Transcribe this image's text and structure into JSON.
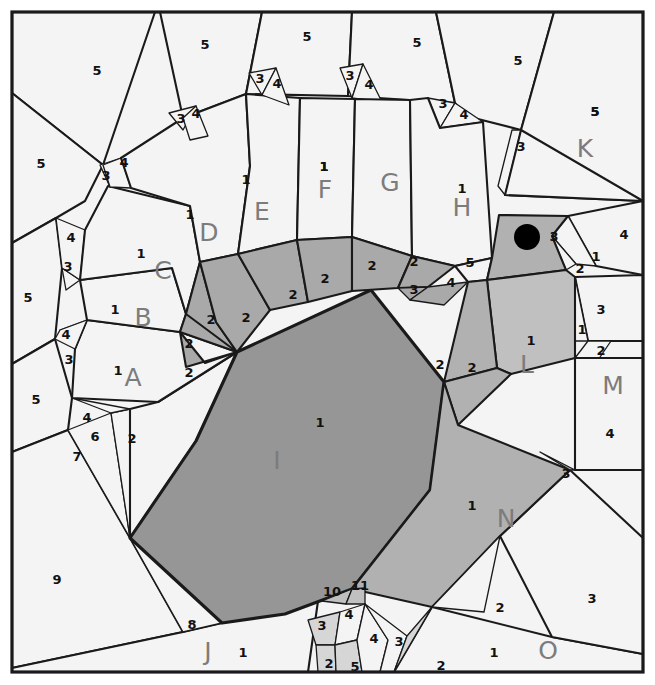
{
  "figure": {
    "width": 655,
    "height": 685,
    "background_color": "#ffffff",
    "frame_color": "#1a1a1a"
  },
  "palette": {
    "background_cell": "#f4f4f4",
    "light_gray": "#e9e9e9",
    "mid_gray": "#c9c9c9",
    "ring_gray": "#a9a9a9",
    "region_gray": "#b1b1b1",
    "core_dark": "#969696",
    "outline": "#1a1a1a",
    "letter_text": "#7c7c7c",
    "number_text": "#111111",
    "marker": "#000000"
  },
  "marker": {
    "name": "black-dot",
    "cx": 527,
    "cy": 237,
    "r": 13
  },
  "region_letters": [
    {
      "id": "A",
      "label": "A",
      "x": 133,
      "y": 379
    },
    {
      "id": "B",
      "label": "B",
      "x": 143,
      "y": 319
    },
    {
      "id": "C",
      "label": "C",
      "x": 163,
      "y": 272
    },
    {
      "id": "D",
      "label": "D",
      "x": 209,
      "y": 234
    },
    {
      "id": "E",
      "label": "E",
      "x": 262,
      "y": 213
    },
    {
      "id": "F",
      "label": "F",
      "x": 325,
      "y": 191
    },
    {
      "id": "G",
      "label": "G",
      "x": 390,
      "y": 184
    },
    {
      "id": "H",
      "label": "H",
      "x": 462,
      "y": 209
    },
    {
      "id": "I",
      "label": "I",
      "x": 277,
      "y": 462
    },
    {
      "id": "J",
      "label": "J",
      "x": 208,
      "y": 653
    },
    {
      "id": "K",
      "label": "K",
      "x": 585,
      "y": 150
    },
    {
      "id": "L",
      "label": "L",
      "x": 527,
      "y": 366
    },
    {
      "id": "M",
      "label": "M",
      "x": 613,
      "y": 387
    },
    {
      "id": "N",
      "label": "N",
      "x": 506,
      "y": 520
    },
    {
      "id": "O",
      "label": "O",
      "x": 548,
      "y": 652
    }
  ],
  "cells": [
    {
      "name": "cell-outer-top-left-5",
      "value": "5",
      "fill": "#f4f4f4",
      "stroke": "med",
      "lx": 97,
      "ly": 71,
      "points": "12,12 155,12 103,165 12,93"
    },
    {
      "name": "cell-outer-top-5a",
      "value": "5",
      "fill": "#f4f4f4",
      "stroke": "med",
      "lx": 205,
      "ly": 45,
      "points": "155,12 262,12 246,94 183,118 160,12"
    },
    {
      "name": "cell-outer-top-5b",
      "value": "5",
      "fill": "#f4f4f4",
      "stroke": "med",
      "lx": 307,
      "ly": 37,
      "points": "262,12 352,12 348,96 246,94"
    },
    {
      "name": "cell-outer-top-5c",
      "value": "5",
      "fill": "#f4f4f4",
      "stroke": "med",
      "lx": 417,
      "ly": 43,
      "points": "352,12 436,12 455,103 348,96"
    },
    {
      "name": "cell-outer-top-5d",
      "value": "5",
      "fill": "#f4f4f4",
      "stroke": "med",
      "lx": 518,
      "ly": 61,
      "points": "436,12 554,12 521,130 466,116 455,103"
    },
    {
      "name": "cell-outer-right-5k",
      "value": "5",
      "fill": "#f4f4f4",
      "stroke": "med",
      "lx": 595,
      "ly": 112,
      "points": "554,12 643,12 643,201 505,195 521,130"
    },
    {
      "name": "cell-outer-left-5b",
      "value": "5",
      "fill": "#f4f4f4",
      "stroke": "med",
      "lx": 41,
      "ly": 164,
      "points": "12,93 103,165 85,201 56,218 12,243"
    },
    {
      "name": "cell-outer-left-5c",
      "value": "5",
      "fill": "#f4f4f4",
      "stroke": "med",
      "lx": 28,
      "ly": 298,
      "points": "12,243 56,218 62,268 55,339 12,364"
    },
    {
      "name": "cell-outer-left-5d",
      "value": "5",
      "fill": "#f4f4f4",
      "stroke": "med",
      "lx": 36,
      "ly": 400,
      "points": "12,364 55,339 72,398 68,430 12,452"
    },
    {
      "name": "cell-outer-bottom-left-9",
      "value": "9",
      "fill": "#f4f4f4",
      "stroke": "med",
      "lx": 57,
      "ly": 580,
      "points": "12,452 68,430 130,538 183,632 12,668"
    },
    {
      "name": "cell-J",
      "value": "1",
      "fill": "#f4f4f4",
      "stroke": "med",
      "lx": 243,
      "ly": 653,
      "points": "183,632 318,601 308,672 12,672 12,668"
    },
    {
      "name": "cell-tri-8",
      "value": "8",
      "fill": "#f4f4f4",
      "stroke": "thin",
      "lx": 192,
      "ly": 625,
      "points": "130,538 222,623 183,632"
    },
    {
      "name": "cell-fan-7",
      "value": "7",
      "fill": "#f4f4f4",
      "stroke": "thin",
      "lx": 77,
      "ly": 457,
      "points": "68,430 111,413 130,538"
    },
    {
      "name": "cell-fan-6",
      "value": "6",
      "fill": "#f4f4f4",
      "stroke": "thin",
      "lx": 95,
      "ly": 437,
      "points": "111,413 130,409 130,538"
    },
    {
      "name": "cell-fan-4low",
      "value": "4",
      "fill": "#f4f4f4",
      "stroke": "thin",
      "lx": 87,
      "ly": 418,
      "points": "72,398 130,409 111,413"
    },
    {
      "name": "cell-mid-2-lowerleft",
      "value": "2",
      "fill": "#f4f4f4",
      "stroke": "med",
      "lx": 132,
      "ly": 439,
      "points": "130,409 158,402 237,352 196,441 130,538"
    },
    {
      "name": "cell-A",
      "value": "1",
      "fill": "#f4f4f4",
      "stroke": "med",
      "lx": 118,
      "ly": 371,
      "points": "75,349 87,320 180,332 237,352 158,402 72,398"
    },
    {
      "name": "cell-tri-3A",
      "value": "3",
      "fill": "#f4f4f4",
      "stroke": "thin",
      "lx": 69,
      "ly": 360,
      "points": "60,330 87,320 75,349"
    },
    {
      "name": "cell-tri-4A",
      "value": "4",
      "fill": "#f4f4f4",
      "stroke": "thin",
      "lx": 66,
      "ly": 335,
      "points": "55,339 60,330 87,320 75,349"
    },
    {
      "name": "cell-B",
      "value": "1",
      "fill": "#f4f4f4",
      "stroke": "med",
      "lx": 115,
      "ly": 310,
      "points": "80,280 172,268 186,314 180,332 87,320"
    },
    {
      "name": "cell-tri-3B",
      "value": "3",
      "fill": "#f4f4f4",
      "stroke": "thin",
      "lx": 68,
      "ly": 267,
      "points": "62,268 80,280 66,290"
    },
    {
      "name": "cell-tri-4B",
      "value": "4",
      "fill": "#f4f4f4",
      "stroke": "thin",
      "lx": 71,
      "ly": 238,
      "points": "56,218 85,230 80,280 62,268"
    },
    {
      "name": "cell-C",
      "value": "1",
      "fill": "#f4f4f4",
      "stroke": "med",
      "lx": 141,
      "ly": 254,
      "points": "108,186 190,206 200,262 186,314 172,268 80,280 85,230"
    },
    {
      "name": "cell-tri-3C",
      "value": "3",
      "fill": "#f4f4f4",
      "stroke": "thin",
      "lx": 106,
      "ly": 176,
      "points": "100,165 121,158 110,187"
    },
    {
      "name": "cell-tri-4C",
      "value": "4",
      "fill": "#f4f4f4",
      "stroke": "thin",
      "lx": 124,
      "ly": 163,
      "points": "103,165 121,158 131,188 110,187"
    },
    {
      "name": "cell-D",
      "value": "1",
      "fill": "#f4f4f4",
      "stroke": "med",
      "lx": 190,
      "ly": 215,
      "points": "183,118 246,94 250,166 238,254 200,262 190,206 131,188 121,158"
    },
    {
      "name": "cell-tri-3D",
      "value": "3",
      "fill": "#f4f4f4",
      "stroke": "thin",
      "lx": 181,
      "ly": 119,
      "points": "169,113 196,106 183,130"
    },
    {
      "name": "cell-tri-4D",
      "value": "4",
      "fill": "#f4f4f4",
      "stroke": "thin",
      "lx": 196,
      "ly": 114,
      "points": "183,118 196,106 208,136 190,140"
    },
    {
      "name": "cell-E",
      "value": "1",
      "fill": "#f4f4f4",
      "stroke": "med",
      "lx": 246,
      "ly": 180,
      "points": "246,94 300,98 297,240 238,254 250,166"
    },
    {
      "name": "cell-tri-3E",
      "value": "3",
      "fill": "#f4f4f4",
      "stroke": "thin",
      "lx": 260,
      "ly": 79,
      "points": "249,73 276,68 262,95"
    },
    {
      "name": "cell-tri-4E",
      "value": "4",
      "fill": "#f4f4f4",
      "stroke": "thin",
      "lx": 277,
      "ly": 84,
      "points": "262,95 276,68 289,105"
    },
    {
      "name": "cell-F",
      "value": "1",
      "fill": "#f4f4f4",
      "stroke": "med",
      "lx": 324,
      "ly": 167,
      "points": "300,98 355,99 352,237 297,240"
    },
    {
      "name": "cell-tri-3F",
      "value": "3",
      "fill": "#f4f4f4",
      "stroke": "thin",
      "lx": 350,
      "ly": 76,
      "points": "340,68 363,64 352,98"
    },
    {
      "name": "cell-tri-4F",
      "value": "4",
      "fill": "#f4f4f4",
      "stroke": "thin",
      "lx": 369,
      "ly": 85,
      "points": "352,98 363,64 382,102"
    },
    {
      "name": "cell-G",
      "value": "1",
      "fill": "#f4f4f4",
      "stroke": "med",
      "lx": 324,
      "ly": 167,
      "points": "355,99 410,100 412,256 352,237"
    },
    {
      "name": "cell-tri-3G",
      "value": "3",
      "fill": "#f4f4f4",
      "stroke": "thin",
      "lx": 443,
      "ly": 104,
      "points": "428,98 455,103 440,128"
    },
    {
      "name": "cell-tri-4G",
      "value": "4",
      "fill": "#f4f4f4",
      "stroke": "thin",
      "lx": 464,
      "ly": 115,
      "points": "440,128 455,103 483,122"
    },
    {
      "name": "cell-H",
      "value": "1",
      "fill": "#f4f4f4",
      "stroke": "med",
      "lx": 462,
      "ly": 189,
      "points": "410,100 428,98 440,128 483,122 492,258 455,266 412,256"
    },
    {
      "name": "cell-tri-3H",
      "value": "3",
      "fill": "#f4f4f4",
      "stroke": "thin",
      "lx": 521,
      "ly": 147,
      "points": "512,130 521,130 505,195 498,186"
    },
    {
      "name": "cell-K-main",
      "value": "5",
      "fill": "#f4f4f4",
      "stroke": "med",
      "lx": 595,
      "ly": 112,
      "points": "521,130 643,201 643,201 505,195"
    },
    {
      "name": "cell-right-4",
      "value": "4",
      "fill": "#f4f4f4",
      "stroke": "med",
      "lx": 624,
      "ly": 235,
      "points": "568,216 643,201 643,275 596,266"
    },
    {
      "name": "cell-right-1a",
      "value": "1",
      "fill": "#f4f4f4",
      "stroke": "thin",
      "lx": 596,
      "ly": 257,
      "points": "552,236 568,216 596,266 576,264"
    },
    {
      "name": "cell-right-2a",
      "value": "2",
      "fill": "#f4f4f4",
      "stroke": "thin",
      "lx": 580,
      "ly": 269,
      "points": "552,236 576,264 566,270"
    },
    {
      "name": "cell-right-3",
      "value": "3",
      "fill": "#f4f4f4",
      "stroke": "med",
      "lx": 601,
      "ly": 310,
      "points": "575,277 643,275 643,341 588,341"
    },
    {
      "name": "cell-right-1b",
      "value": "1",
      "fill": "#f4f4f4",
      "stroke": "thin",
      "lx": 582,
      "ly": 330,
      "points": "575,277 588,341 575,341"
    },
    {
      "name": "cell-right-2b",
      "value": "2",
      "fill": "#f4f4f4",
      "stroke": "thin",
      "lx": 601,
      "ly": 351,
      "points": "588,341 611,341 598,360 575,358"
    },
    {
      "name": "cell-M",
      "value": "4",
      "fill": "#f4f4f4",
      "stroke": "med",
      "lx": 610,
      "ly": 434,
      "points": "575,358 643,358 643,470 575,470"
    },
    {
      "name": "cell-O",
      "value": "1",
      "fill": "#f4f4f4",
      "stroke": "med",
      "lx": 494,
      "ly": 653,
      "points": "432,607 552,637 643,654 643,672 394,672"
    },
    {
      "name": "cell-O-3",
      "value": "3",
      "fill": "#f4f4f4",
      "stroke": "med",
      "lx": 592,
      "ly": 599,
      "points": "500,536 570,470 643,538 643,654 552,637"
    },
    {
      "name": "cell-dark-I",
      "value": "1",
      "fill": "#969696",
      "stroke": "thick",
      "lx": 320,
      "ly": 423,
      "points": "237,352 371,290 444,382 430,490 352,589 285,614 222,623 130,538 196,441"
    },
    {
      "name": "ring-2a",
      "value": "2",
      "fill": "#a9a9a9",
      "stroke": "med",
      "lx": 189,
      "ly": 373,
      "points": "180,332 205,363 237,352 186,367"
    },
    {
      "name": "ring-2b",
      "value": "2",
      "fill": "#a9a9a9",
      "stroke": "med",
      "lx": 189,
      "ly": 344,
      "points": "186,314 216,322 237,352 180,332"
    },
    {
      "name": "ring-2c",
      "value": "2",
      "fill": "#a9a9a9",
      "stroke": "med",
      "lx": 211,
      "ly": 320,
      "points": "200,262 216,322 237,352 186,314"
    },
    {
      "name": "ring-2d",
      "value": "2",
      "fill": "#a9a9a9",
      "stroke": "med",
      "lx": 246,
      "ly": 318,
      "points": "200,262 238,254 270,310 237,352 216,322"
    },
    {
      "name": "ring-2e",
      "value": "2",
      "fill": "#a9a9a9",
      "stroke": "med",
      "lx": 293,
      "ly": 295,
      "points": "238,254 297,240 308,302 270,310"
    },
    {
      "name": "ring-2f",
      "value": "2",
      "fill": "#a9a9a9",
      "stroke": "med",
      "lx": 325,
      "ly": 279,
      "points": "297,240 352,237 352,291 308,302"
    },
    {
      "name": "ring-2g",
      "value": "2",
      "fill": "#a9a9a9",
      "stroke": "med",
      "lx": 372,
      "ly": 266,
      "points": "352,237 412,256 398,288 352,291"
    },
    {
      "name": "ring-2h",
      "value": "2",
      "fill": "#a9a9a9",
      "stroke": "med",
      "lx": 414,
      "ly": 262,
      "points": "412,256 455,266 428,287 398,288"
    },
    {
      "name": "ring-3i",
      "value": "3",
      "fill": "#a9a9a9",
      "stroke": "thin",
      "lx": 414,
      "ly": 290,
      "points": "398,288 428,287 410,300"
    },
    {
      "name": "ring-4i",
      "value": "4",
      "fill": "#a9a9a9",
      "stroke": "thin",
      "lx": 451,
      "ly": 283,
      "points": "428,287 468,282 444,305 410,300"
    },
    {
      "name": "ring-5i",
      "value": "5",
      "fill": "#f4f4f4",
      "stroke": "med",
      "lx": 470,
      "ly": 263,
      "points": "455,266 492,258 487,280 468,282"
    },
    {
      "name": "cell-dot-3",
      "value": "3",
      "fill": "#b1b1b1",
      "stroke": "med",
      "lx": 554,
      "ly": 237,
      "points": "492,258 499,215 568,216 552,236 566,270 487,280"
    },
    {
      "name": "cell-L",
      "value": "1",
      "fill": "#c0c0c0",
      "stroke": "med",
      "lx": 531,
      "ly": 341,
      "points": "487,280 566,270 575,277 575,358 511,374 497,368"
    },
    {
      "name": "cell-2-left-of-L",
      "value": "2",
      "fill": "#b1b1b1",
      "stroke": "med",
      "lx": 472,
      "ly": 368,
      "points": "468,282 487,280 497,368 444,382"
    },
    {
      "name": "cell-2-above-N",
      "value": "2",
      "fill": "#b1b1b1",
      "stroke": "med",
      "lx": 440,
      "ly": 365,
      "points": "444,382 497,368 511,374 458,425"
    },
    {
      "name": "cell-N",
      "value": "1",
      "fill": "#b1b1b1",
      "stroke": "med",
      "lx": 472,
      "ly": 506,
      "points": "444,382 458,425 570,470 500,536 432,607 352,589 430,490"
    },
    {
      "name": "cell-N-3",
      "value": "3",
      "fill": "#b1b1b1",
      "stroke": "thin",
      "lx": 566,
      "ly": 474,
      "points": "540,452 575,470 570,470"
    },
    {
      "name": "cell-2-below-N",
      "value": "2",
      "fill": "#f4f4f4",
      "stroke": "thin",
      "lx": 500,
      "ly": 608,
      "points": "432,607 500,536 500,536 484,612"
    },
    {
      "name": "bottom-10",
      "value": "10",
      "fill": "#c0c0c0",
      "stroke": "thin",
      "lx": 332,
      "ly": 592,
      "points": "322,601 352,589 346,604"
    },
    {
      "name": "bottom-11",
      "value": "11",
      "fill": "#c0c0c0",
      "stroke": "thin",
      "lx": 360,
      "ly": 586,
      "points": "346,604 352,589 365,588 365,604"
    },
    {
      "name": "bottom-3a",
      "value": "3",
      "fill": "#d6d6d6",
      "stroke": "thin",
      "lx": 322,
      "ly": 626,
      "points": "308,620 340,612 335,645 316,645"
    },
    {
      "name": "bottom-4a",
      "value": "4",
      "fill": "#f4f4f4",
      "stroke": "thin",
      "lx": 349,
      "ly": 615,
      "points": "340,612 365,604 357,640 335,645"
    },
    {
      "name": "bottom-2a",
      "value": "2",
      "fill": "#d6d6d6",
      "stroke": "thin",
      "lx": 329,
      "ly": 664,
      "points": "316,645 335,645 336,672 318,672"
    },
    {
      "name": "bottom-5a",
      "value": "5",
      "fill": "#d6d6d6",
      "stroke": "thin",
      "lx": 355,
      "ly": 667,
      "points": "335,645 357,640 362,672 336,672"
    },
    {
      "name": "bottom-4b",
      "value": "4",
      "fill": "#f4f4f4",
      "stroke": "thin",
      "lx": 374,
      "ly": 639,
      "points": "365,604 388,640 380,672 362,672 357,640"
    },
    {
      "name": "bottom-3b",
      "value": "3",
      "fill": "#f4f4f4",
      "stroke": "thin",
      "lx": 399,
      "ly": 642,
      "points": "365,604 407,636 394,672 380,672 388,640"
    },
    {
      "name": "bottom-2b",
      "value": "2",
      "fill": "#d6d6d6",
      "stroke": "thin",
      "lx": 441,
      "ly": 666,
      "points": "407,636 432,607 394,672"
    }
  ],
  "all_number_labels": [
    "1",
    "2",
    "3",
    "4",
    "5",
    "6",
    "7",
    "8",
    "9",
    "10",
    "11"
  ],
  "letters_sequence": [
    "A",
    "B",
    "C",
    "D",
    "E",
    "F",
    "G",
    "H",
    "I",
    "J",
    "K",
    "L",
    "M",
    "N",
    "O"
  ]
}
